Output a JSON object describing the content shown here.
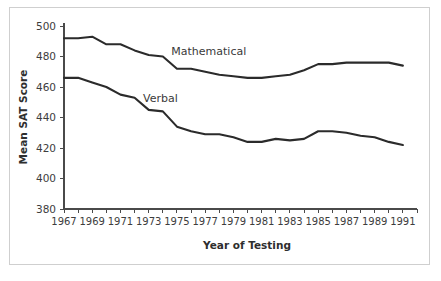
{
  "figure": {
    "top_sliver_text": "",
    "background_color": "#ffffff",
    "frame_color": "#cfcfcf",
    "line_color": "#2b2b2b"
  },
  "chart_data": {
    "type": "line",
    "title": "",
    "xlabel": "Year of Testing",
    "ylabel": "Mean SAT Score",
    "ylim": [
      380,
      500
    ],
    "ytick_values": [
      380,
      400,
      420,
      440,
      460,
      480,
      500
    ],
    "ytick_labels": [
      "380",
      "400",
      "420",
      "440",
      "460",
      "480",
      "500"
    ],
    "xlim": [
      1967,
      1992
    ],
    "x": [
      1967,
      1968,
      1969,
      1970,
      1971,
      1972,
      1973,
      1974,
      1975,
      1976,
      1977,
      1978,
      1979,
      1980,
      1981,
      1982,
      1983,
      1984,
      1985,
      1986,
      1987,
      1988,
      1989,
      1990,
      1991
    ],
    "xtick_values": [
      1967,
      1968,
      1969,
      1970,
      1971,
      1972,
      1973,
      1974,
      1975,
      1976,
      1977,
      1978,
      1979,
      1980,
      1981,
      1982,
      1983,
      1984,
      1985,
      1986,
      1987,
      1988,
      1989,
      1990,
      1991,
      1992
    ],
    "xtick_labels_shown": [
      "1967",
      "1969",
      "1971",
      "1973",
      "1975",
      "1977",
      "1979",
      "1981",
      "1983",
      "1985",
      "1987",
      "1989",
      "1991"
    ],
    "grid": false,
    "legend_position": "inline-annotations",
    "series": [
      {
        "name": "Mathematical",
        "label_text": "Mathematical",
        "values": [
          492,
          492,
          493,
          488,
          488,
          484,
          481,
          480,
          472,
          472,
          470,
          468,
          467,
          466,
          466,
          467,
          468,
          471,
          475,
          475,
          476,
          476,
          476,
          476,
          474
        ]
      },
      {
        "name": "Verbal",
        "label_text": "Verbal",
        "values": [
          466,
          466,
          463,
          460,
          455,
          453,
          445,
          444,
          434,
          431,
          429,
          429,
          427,
          424,
          424,
          426,
          425,
          426,
          431,
          431,
          430,
          428,
          427,
          424,
          422
        ]
      }
    ],
    "annotations": [
      {
        "text": "Mathematical",
        "x": 1974.6,
        "y": 481
      },
      {
        "text": "Verbal",
        "x": 1972.6,
        "y": 450
      }
    ]
  }
}
